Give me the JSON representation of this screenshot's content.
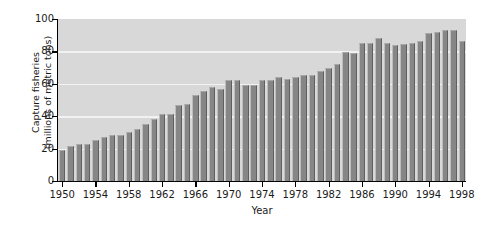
{
  "chart_data": {
    "type": "bar",
    "title": "",
    "xlabel": "Year",
    "ylabel": "Capture fisheries (millions of metric tons)",
    "ylabel_line1": "Capture fisheries",
    "ylabel_line2": "(millions of metric tons)",
    "ylim": [
      0,
      100
    ],
    "xlim": [
      1950,
      1998
    ],
    "ytick_labels": [
      "0",
      "20",
      "40",
      "60",
      "80",
      "100"
    ],
    "ytick_values": [
      0,
      20,
      40,
      60,
      80,
      100
    ],
    "xtick_labels": [
      "1950",
      "1954",
      "1958",
      "1962",
      "1966",
      "1970",
      "1974",
      "1978",
      "1982",
      "1986",
      "1990",
      "1994",
      "1998"
    ],
    "xtick_values": [
      1950,
      1954,
      1958,
      1962,
      1966,
      1970,
      1974,
      1978,
      1982,
      1986,
      1990,
      1994,
      1998
    ],
    "grid": "horizontal-white",
    "legend": "none",
    "categories": [
      1950,
      1951,
      1952,
      1953,
      1954,
      1955,
      1956,
      1957,
      1958,
      1959,
      1960,
      1961,
      1962,
      1963,
      1964,
      1965,
      1966,
      1967,
      1968,
      1969,
      1970,
      1971,
      1972,
      1973,
      1974,
      1975,
      1976,
      1977,
      1978,
      1979,
      1980,
      1981,
      1982,
      1983,
      1984,
      1985,
      1986,
      1987,
      1988,
      1989,
      1990,
      1991,
      1992,
      1993,
      1994,
      1995,
      1996,
      1997,
      1998
    ],
    "values": [
      19,
      21.5,
      23,
      23,
      25.5,
      27,
      28.5,
      28.5,
      30,
      32,
      35,
      38,
      41.5,
      41.5,
      47,
      47.5,
      53,
      55.5,
      58,
      56.5,
      62.5,
      62.5,
      59,
      59,
      62.5,
      62.5,
      64.5,
      63,
      64.5,
      65.5,
      65.5,
      68,
      69.5,
      72,
      79.5,
      79,
      85,
      85,
      88.5,
      85,
      84,
      84.5,
      85,
      86.5,
      91.5,
      92,
      93.5,
      93.5,
      86.5
    ],
    "bar_color": "#868686",
    "plot_background": "#d8d8d8",
    "gridline_color": "#f2f2f2",
    "axis_color": "#000000",
    "figure_background": "#ffffff"
  }
}
